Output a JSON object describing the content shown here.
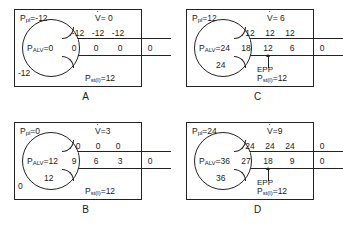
{
  "figure": {
    "ink_color": "#1a1a1a",
    "background": "#ffffff"
  },
  "panels": [
    {
      "letter": "A",
      "ppl_label": "P",
      "ppl_sub": "pl",
      "ppl_value": "=-12",
      "flow_label": "V",
      "flow_value": "= 0",
      "palv_label": "P",
      "palv_sub": "ALV",
      "palv_value": "=0",
      "alveolus_number": "",
      "corner_number": "-12",
      "pst_label": "P",
      "pst_sub": "st(l)",
      "pst_value": "=12",
      "upper_row": [
        "-12",
        "-12",
        "-12"
      ],
      "lower_row": [
        "0",
        "0",
        "0",
        "0"
      ],
      "has_epp": false,
      "epp_label": ""
    },
    {
      "letter": "C",
      "ppl_label": "P",
      "ppl_sub": "pl",
      "ppl_value": "=12",
      "flow_label": "V",
      "flow_value": "= 6",
      "palv_label": "P",
      "palv_sub": "ALV",
      "palv_value": "=24",
      "alveolus_number": "24",
      "corner_number": "",
      "pst_label": "P",
      "pst_sub": "st(l)",
      "pst_value": "=12",
      "upper_row": [
        "12",
        "12",
        "12"
      ],
      "lower_row": [
        "18",
        "12",
        "6",
        "0"
      ],
      "has_epp": true,
      "epp_label": "EPP"
    },
    {
      "letter": "B",
      "ppl_label": "P",
      "ppl_sub": "pl",
      "ppl_value": "=0",
      "flow_label": "V",
      "flow_value": "=3",
      "palv_label": "P",
      "palv_sub": "ALV",
      "palv_value": "=12",
      "alveolus_number": "12",
      "corner_number": "0",
      "pst_label": "P",
      "pst_sub": "st(l)",
      "pst_value": "=12",
      "upper_row": [
        "0",
        "0",
        "0"
      ],
      "lower_row": [
        "9",
        "6",
        "3",
        "0"
      ],
      "has_epp": false,
      "epp_label": ""
    },
    {
      "letter": "D",
      "ppl_label": "P",
      "ppl_sub": "pl",
      "ppl_value": "=24",
      "flow_label": "V",
      "flow_value": "=9",
      "palv_label": "P",
      "palv_sub": "ALV",
      "palv_value": "=36",
      "alveolus_number": "36",
      "corner_number": "",
      "pst_label": "P",
      "pst_sub": "st(l)",
      "pst_value": "=12",
      "upper_row": [
        "24",
        "24",
        "24",
        "0"
      ],
      "lower_row": [
        "27",
        "18",
        "9",
        "0"
      ],
      "has_epp": true,
      "epp_label": "EPP"
    }
  ]
}
